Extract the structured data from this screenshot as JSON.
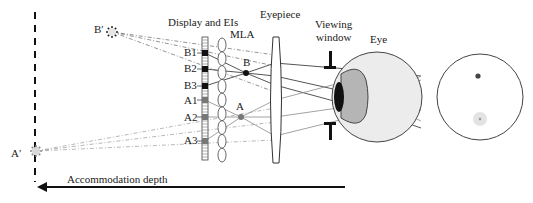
{
  "labels": {
    "display_and_eis": "Display and EIs",
    "mla": "MLA",
    "eyepiece": "Eyepiece",
    "viewing_window_line1": "Viewing",
    "viewing_window_line2": "window",
    "eye": "Eye",
    "accommodation_depth": "Accommodation depth"
  },
  "points": {
    "b_prime": "B′",
    "a_prime": "A′",
    "b": "B",
    "a": "A"
  },
  "elemental_images": [
    {
      "label": "B1",
      "group": "B"
    },
    {
      "label": "B2",
      "group": "B"
    },
    {
      "label": "B3",
      "group": "B"
    },
    {
      "label": "A1",
      "group": "A"
    },
    {
      "label": "A2",
      "group": "A"
    },
    {
      "label": "A3",
      "group": "A"
    }
  ],
  "colors": {
    "b_rays": "#2a2a2a",
    "a_rays": "#8a8a8a",
    "eye_fill": "#ececec",
    "lens_fill": "#b5b5b5",
    "pupil": "#111111",
    "retina_b": "#444444",
    "retina_a": "#bdbdbd"
  }
}
